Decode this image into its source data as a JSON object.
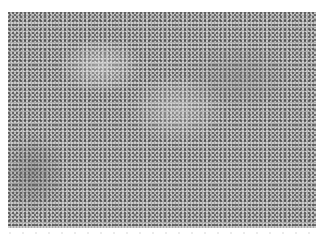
{
  "image": {
    "description": "Grayscale light micrograph of densely packed cellular tissue",
    "colors": {
      "background": "#ffffff",
      "tissue_base": "#a9a9a9",
      "nuclei": "#464646"
    }
  }
}
